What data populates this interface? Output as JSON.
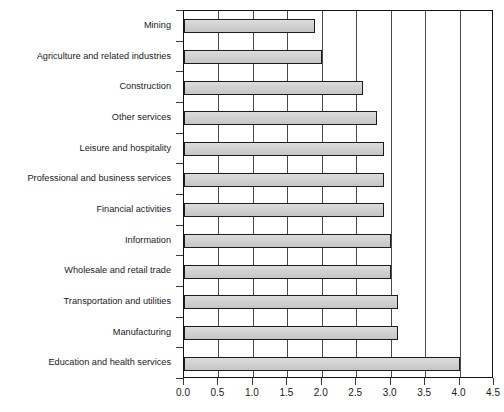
{
  "chart_data": {
    "type": "bar",
    "orientation": "horizontal",
    "title": "",
    "subtitle": "",
    "xlabel": "",
    "ylabel": "",
    "xlim": [
      0.0,
      4.5
    ],
    "xticks": [
      "0.0",
      "0.5",
      "1.0",
      "1.5",
      "2.0",
      "2.5",
      "3.0",
      "3.5",
      "4.0",
      "4.5"
    ],
    "xtick_values": [
      0.0,
      0.5,
      1.0,
      1.5,
      2.0,
      2.5,
      3.0,
      3.5,
      4.0,
      4.5
    ],
    "grid": "vertical",
    "legend": "none",
    "bar_fill_color": "#d2d2d2",
    "bar_edge_color": "#1c1c1c",
    "axis_color": "#111111",
    "categories": [
      "Mining",
      "Agriculture and related industries",
      "Construction",
      "Other services",
      "Leisure and hospitality",
      "Professional and business services",
      "Financial activities",
      "Information",
      "Wholesale and retail trade",
      "Transportation and utilities",
      "Manufacturing",
      "Education and health services"
    ],
    "values": [
      1.9,
      2.0,
      2.6,
      2.8,
      2.9,
      2.9,
      2.9,
      3.0,
      3.0,
      3.1,
      3.1,
      4.0
    ]
  }
}
